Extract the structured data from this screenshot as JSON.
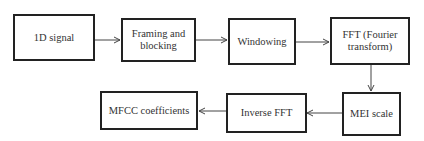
{
  "diagram": {
    "type": "flowchart",
    "nodes": [
      {
        "id": "n1",
        "label": "1D signal"
      },
      {
        "id": "n2",
        "label": "Framing and blocking"
      },
      {
        "id": "n3",
        "label": "Windowing"
      },
      {
        "id": "n4",
        "label": "FFT (Fourier transform)"
      },
      {
        "id": "n5",
        "label": "MEI scale"
      },
      {
        "id": "n6",
        "label": "Inverse FFT"
      },
      {
        "id": "n7",
        "label": "MFCC coefficients"
      }
    ],
    "edges": [
      {
        "from": "n1",
        "to": "n2"
      },
      {
        "from": "n2",
        "to": "n3"
      },
      {
        "from": "n3",
        "to": "n4"
      },
      {
        "from": "n4",
        "to": "n5"
      },
      {
        "from": "n5",
        "to": "n6"
      },
      {
        "from": "n6",
        "to": "n7"
      }
    ]
  },
  "colors": {
    "border": "#222222",
    "text": "#333333",
    "arrow": "#444444",
    "background": "#ffffff"
  }
}
